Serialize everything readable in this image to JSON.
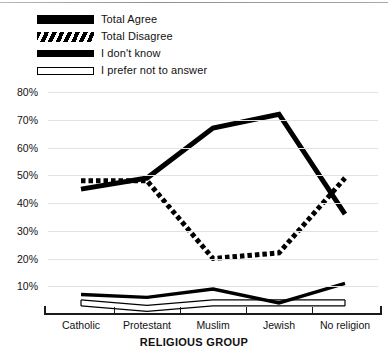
{
  "chart_data": {
    "type": "line",
    "title": "",
    "xlabel": "RELIGIOUS GROUP",
    "ylabel": "",
    "categories": [
      "Catholic",
      "Protestant",
      "Muslim",
      "Jewish",
      "No religion"
    ],
    "series": [
      {
        "name": "Total Agree",
        "style": "thick-solid",
        "values": [
          45,
          49,
          67,
          72,
          36
        ]
      },
      {
        "name": "Total Disagree",
        "style": "thick-dashed",
        "values": [
          48,
          48,
          20,
          22,
          49
        ]
      },
      {
        "name": "I don't know",
        "style": "medium-solid",
        "values": [
          7,
          6,
          9,
          4,
          11
        ]
      },
      {
        "name": "I prefer not to answer",
        "style": "thin-outline",
        "values": [
          4,
          2,
          4,
          4,
          4
        ]
      }
    ],
    "ylim": [
      0,
      80
    ],
    "yticks": [
      10,
      20,
      30,
      40,
      50,
      60,
      70,
      80
    ],
    "ytick_labels": [
      "10%",
      "20%",
      "30%",
      "40%",
      "50%",
      "60%",
      "70%",
      "80%"
    ],
    "grid": true,
    "legend_position": "top-left",
    "colors": {
      "line": "#000000",
      "grid": "#e2e2e2",
      "axis": "#1a1a1a",
      "background": "#ffffff"
    }
  },
  "legend": {
    "items": [
      {
        "label": "Total Agree"
      },
      {
        "label": "Total Disagree"
      },
      {
        "label": "I don't know"
      },
      {
        "label": "I prefer not to answer"
      }
    ]
  }
}
